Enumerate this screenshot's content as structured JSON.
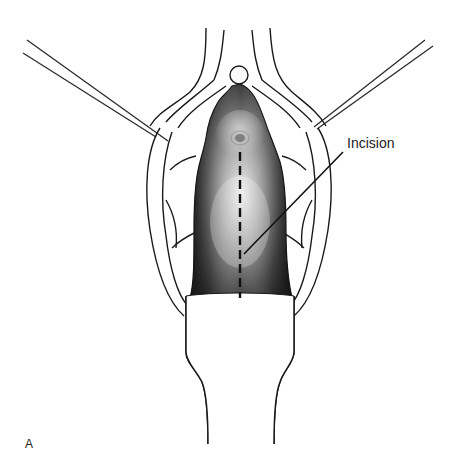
{
  "figure": {
    "panel_letter": "A",
    "annotation": {
      "label": "Incision"
    },
    "colors": {
      "line": "#1a1a1a",
      "tissue_dark": "#2b2b2b",
      "tissue_mid": "#6e6e6e",
      "tissue_light": "#e6e6e6",
      "background": "#ffffff"
    }
  }
}
